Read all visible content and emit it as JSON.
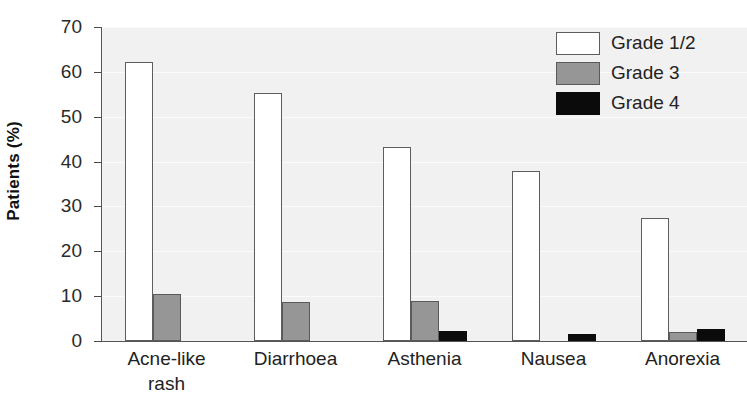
{
  "chart_data": {
    "type": "bar",
    "title": "",
    "xlabel": "",
    "ylabel": "Patients (%)",
    "ylim": [
      0,
      70
    ],
    "yticks": [
      0,
      10,
      20,
      30,
      40,
      50,
      60,
      70
    ],
    "ytick_labels": [
      "0",
      "10",
      "20",
      "30",
      "40",
      "50",
      "60",
      "70"
    ],
    "grid": true,
    "grid_axis": "y",
    "legend_position": "top-right",
    "categories": [
      "Acne-like rash",
      "Diarrhoea",
      "Asthenia",
      "Nausea",
      "Anorexia"
    ],
    "category_display": [
      "Acne-like\nrash",
      "Diarrhoea",
      "Asthenia",
      "Nausea",
      "Anorexia"
    ],
    "series": [
      {
        "name": "Grade 1/2",
        "color": "#ffffff",
        "edge_color": "#5d5d5d",
        "values": [
          62.2,
          55.2,
          43.2,
          37.8,
          27.5
        ]
      },
      {
        "name": "Grade 3",
        "color": "#969696",
        "edge_color": "#5a5a5a",
        "values": [
          10.4,
          8.7,
          9.0,
          0,
          2.0
        ]
      },
      {
        "name": "Grade 4",
        "color": "#0b0b0b",
        "edge_color": "#0b0b0b",
        "values": [
          0,
          0,
          2.2,
          1.5,
          2.7
        ]
      }
    ],
    "plot_background": "#f1f1f1",
    "axis_color": "#555555"
  },
  "legend": {
    "entries": [
      {
        "label": "Grade 1/2"
      },
      {
        "label": "Grade 3"
      },
      {
        "label": "Grade 4"
      }
    ]
  }
}
